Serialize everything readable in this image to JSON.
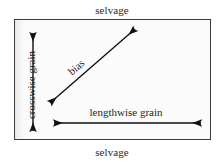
{
  "diagram": {
    "colors": {
      "border": "#3a3a3a",
      "fill": "#fbfbfb",
      "arrow": "#111111",
      "text": "#1d1d1d",
      "page_background": "#ffffff"
    },
    "selvage_top_label": "selvage",
    "selvage_bottom_label": "selvage",
    "crosswise_grain_label": "crosswise grain",
    "lengthwise_grain_label": "lengthwise grain",
    "bias_label": "bias",
    "arrows": {
      "crosswise": {
        "name": "crosswise-grain-arrow",
        "x1": 33,
        "y1": 31,
        "x2": 33,
        "y2": 133,
        "double_headed": true
      },
      "lengthwise": {
        "name": "lengthwise-grain-arrow",
        "x1": 52,
        "y1": 123,
        "x2": 203,
        "y2": 123,
        "double_headed": true
      },
      "bias": {
        "name": "bias-arrow",
        "x1": 48,
        "y1": 105,
        "x2": 137,
        "y2": 27,
        "double_headed": true
      }
    },
    "rectangle": {
      "x": 14,
      "y": 19,
      "width": 195,
      "height": 119
    }
  }
}
